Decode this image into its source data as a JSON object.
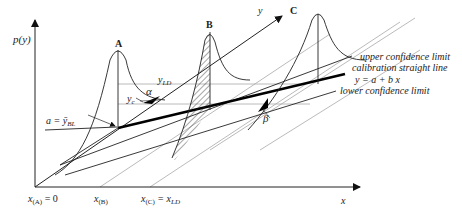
{
  "diagram": {
    "axes": {
      "vertical_label": "p(y)",
      "horizontal_label": "x",
      "oblique_label": "y"
    },
    "peaks": [
      {
        "id": "A",
        "label": "A"
      },
      {
        "id": "B",
        "label": "B"
      },
      {
        "id": "C",
        "label": "C"
      }
    ],
    "annotations": {
      "intercept": "a = ȳ",
      "intercept_sub": "BL",
      "y_c": "y",
      "y_c_sub": "c",
      "y_ld": "y",
      "y_ld_sub": "LD",
      "alpha": "α",
      "beta": "β"
    },
    "legend": {
      "upper": "upper confidence limit",
      "calibration": "calibration straight line",
      "equation": "y = a + b x",
      "lower": "lower confidence limit"
    },
    "x_ticks": {
      "a_main": "x",
      "a_sub": "(A)",
      "a_suffix": " = 0",
      "b_main": "x",
      "b_sub": "(B)",
      "c_main": "x",
      "c_sub": "(C)",
      "c_eq": " = x",
      "c_eq_sub": "LD"
    },
    "colors": {
      "line": "#222222",
      "grey_line": "#9a9a9a",
      "calibration": "#000000"
    }
  }
}
